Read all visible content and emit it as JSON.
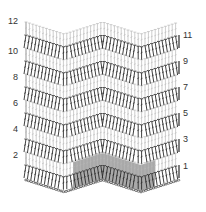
{
  "diagram": {
    "type": "crochet-chevron-stitch-chart",
    "colors": {
      "odd_row_stitch": "#2a2a2a",
      "even_row_stitch": "#b8b8b8",
      "repeat_shading": "#9a9a9a",
      "label": "#333333",
      "background": "#ffffff"
    },
    "left_labels": [
      {
        "text": "12",
        "y": 16
      },
      {
        "text": "10",
        "y": 46
      },
      {
        "text": "8",
        "y": 72
      },
      {
        "text": "6",
        "y": 98
      },
      {
        "text": "4",
        "y": 124
      },
      {
        "text": "2",
        "y": 150
      }
    ],
    "right_labels": [
      {
        "text": "11",
        "y": 30
      },
      {
        "text": "9",
        "y": 56
      },
      {
        "text": "7",
        "y": 82
      },
      {
        "text": "5",
        "y": 108
      },
      {
        "text": "3",
        "y": 134
      },
      {
        "text": "1",
        "y": 161
      }
    ],
    "rows": 12,
    "shaded_repeat": "pattern repeat highlighted in grey across row 1"
  }
}
